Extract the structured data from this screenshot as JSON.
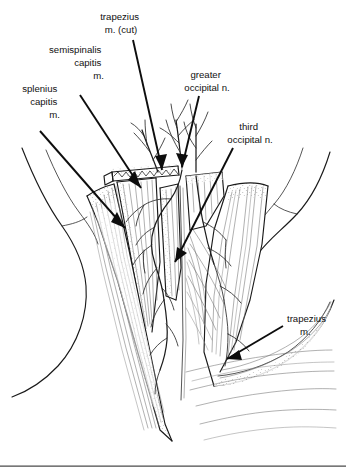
{
  "figure": {
    "background_color": "#ffffff",
    "ink_color": "#111111",
    "rule_color": "#4a4a4a"
  },
  "labels": [
    {
      "id": "trapezius-cut",
      "name": "trapezius m. (cut)",
      "lines": [
        "trapezius",
        "m. (cut)"
      ],
      "align": "middle",
      "text_x": 121,
      "text_y": 20,
      "leader": "M 133 40 L 162 170",
      "arrow_at": [
        162,
        170
      ],
      "arrow_angle": 77
    },
    {
      "id": "semispinalis-capitis",
      "name": "semispinalis capitis m.",
      "lines": [
        "semispinalis",
        "capitis",
        "m."
      ],
      "align": "end",
      "text_x": 104,
      "text_y": 53,
      "leader": "M 80 95 L 141 188",
      "arrow_at": [
        141,
        188
      ],
      "arrow_angle": 57
    },
    {
      "id": "splenius-capitis",
      "name": "splenius capitis m.",
      "lines": [
        "splenius",
        "capitis",
        "m."
      ],
      "align": "end",
      "text_x": 60,
      "text_y": 92,
      "leader": "M 40 131 L 125 228",
      "arrow_at": [
        125,
        228
      ],
      "arrow_angle": 49
    },
    {
      "id": "greater-occipital-n",
      "name": "greater occipital n.",
      "lines": [
        "greater",
        "occipital n."
      ],
      "align": "middle",
      "text_x": 207,
      "text_y": 78,
      "leader": "M 199 96 L 182 167",
      "arrow_at": [
        182,
        167
      ],
      "arrow_angle": 104
    },
    {
      "id": "third-occipital-n",
      "name": "third occipital n.",
      "lines": [
        "third",
        "occipital n."
      ],
      "align": "middle",
      "text_x": 250,
      "text_y": 130,
      "leader": "M 233 148 L 175 262",
      "arrow_at": [
        175,
        262
      ],
      "arrow_angle": 117
    },
    {
      "id": "trapezius",
      "name": "trapezius m.",
      "lines": [
        "trapezius",
        "m."
      ],
      "align": "start",
      "text_x": 287,
      "text_y": 322,
      "leader": "M 283 326 L 227 359",
      "arrow_at": [
        227,
        359
      ],
      "arrow_angle": 150
    }
  ],
  "structures": [
    {
      "id": "splenius-capitis-muscle",
      "name": "splenius capitis muscle"
    },
    {
      "id": "semispinalis-capitis-muscle",
      "name": "semispinalis capitis muscle"
    },
    {
      "id": "trapezius-cut-edge",
      "name": "cut edge of trapezius muscle"
    },
    {
      "id": "trapezius-flap",
      "name": "reflected trapezius muscle flap"
    },
    {
      "id": "greater-occipital-nerve",
      "name": "greater occipital nerve"
    },
    {
      "id": "third-occipital-nerve",
      "name": "third occipital nerve"
    },
    {
      "id": "neck-contour-left",
      "name": "left neck and shoulder contour"
    },
    {
      "id": "neck-contour-right",
      "name": "right neck and shoulder contour"
    },
    {
      "id": "midline-raphe",
      "name": "midline nuchal raphe"
    }
  ],
  "footer_rule": {
    "y": 466
  }
}
